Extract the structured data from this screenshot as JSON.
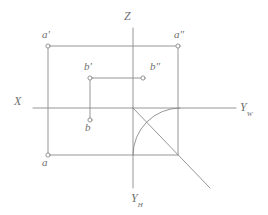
{
  "figure": {
    "kind": "descriptive-geometry-projection-diagram",
    "background_color": "#ffffff",
    "line_color": "#8a8a8a",
    "label_color": "#6f6f6f",
    "canvas": {
      "width": 268,
      "height": 215
    }
  },
  "axes": {
    "origin": {
      "x": 133,
      "y": 108
    },
    "z_axis": {
      "label": "Z",
      "label_pos": {
        "x": 124,
        "y": 10
      },
      "x1": 133,
      "y1": 28,
      "x2": 133,
      "y2": 108
    },
    "x_axis": {
      "label": "X",
      "label_pos": {
        "x": 14,
        "y": 95
      },
      "x1": 33,
      "y1": 108,
      "x2": 133,
      "y2": 108
    },
    "yw_axis": {
      "label": "Y",
      "sublabel": "W",
      "label_pos": {
        "x": 240,
        "y": 101
      },
      "x1": 133,
      "y1": 108,
      "x2": 236,
      "y2": 108
    },
    "yh_axis": {
      "label": "Y",
      "sublabel": "H",
      "label_pos": {
        "x": 131,
        "y": 192
      },
      "x1": 133,
      "y1": 108,
      "x2": 133,
      "y2": 188
    }
  },
  "points": [
    {
      "id": "a-front",
      "label": "a",
      "prime": "′",
      "marker": {
        "x": 48,
        "y": 46
      },
      "label_pos": {
        "x": 42,
        "y": 29
      }
    },
    {
      "id": "a-side",
      "label": "a",
      "prime": "″",
      "marker": {
        "x": 178,
        "y": 46
      },
      "label_pos": {
        "x": 174,
        "y": 29
      }
    },
    {
      "id": "a-top",
      "label": "a",
      "prime": "",
      "marker": {
        "x": 48,
        "y": 155
      },
      "label_pos": {
        "x": 42,
        "y": 157
      }
    },
    {
      "id": "b-front",
      "label": "b",
      "prime": "′",
      "marker": {
        "x": 90,
        "y": 78
      },
      "label_pos": {
        "x": 84,
        "y": 61
      }
    },
    {
      "id": "b-side",
      "label": "b",
      "prime": "″",
      "marker": {
        "x": 143,
        "y": 78
      },
      "label_pos": {
        "x": 150,
        "y": 61
      }
    },
    {
      "id": "b-top",
      "label": "b",
      "prime": "",
      "marker": {
        "x": 90,
        "y": 120
      },
      "label_pos": {
        "x": 85,
        "y": 122
      }
    }
  ],
  "construction": {
    "rect_a": {
      "top": {
        "x1": 48,
        "y1": 46,
        "x2": 178,
        "y2": 46
      },
      "left": {
        "x1": 48,
        "y1": 46,
        "x2": 48,
        "y2": 155
      },
      "right": {
        "x1": 178,
        "y1": 46,
        "x2": 178,
        "y2": 155
      },
      "bottom": {
        "x1": 48,
        "y1": 155,
        "x2": 178,
        "y2": 155
      }
    },
    "b_connector": {
      "x1": 90,
      "y1": 78,
      "x2": 143,
      "y2": 78
    },
    "b_vertical": {
      "x1": 90,
      "y1": 78,
      "x2": 90,
      "y2": 120
    },
    "bisector_45": {
      "x1": 133,
      "y1": 108,
      "x2": 210,
      "y2": 188
    },
    "arc_quarter": {
      "center": {
        "x": 133,
        "y": 108
      },
      "radius": 47,
      "from": {
        "x": 178,
        "y": 108
      },
      "to": {
        "x": 133,
        "y": 155
      },
      "note": "quarter circle from Yw axis to Yh axis"
    }
  }
}
